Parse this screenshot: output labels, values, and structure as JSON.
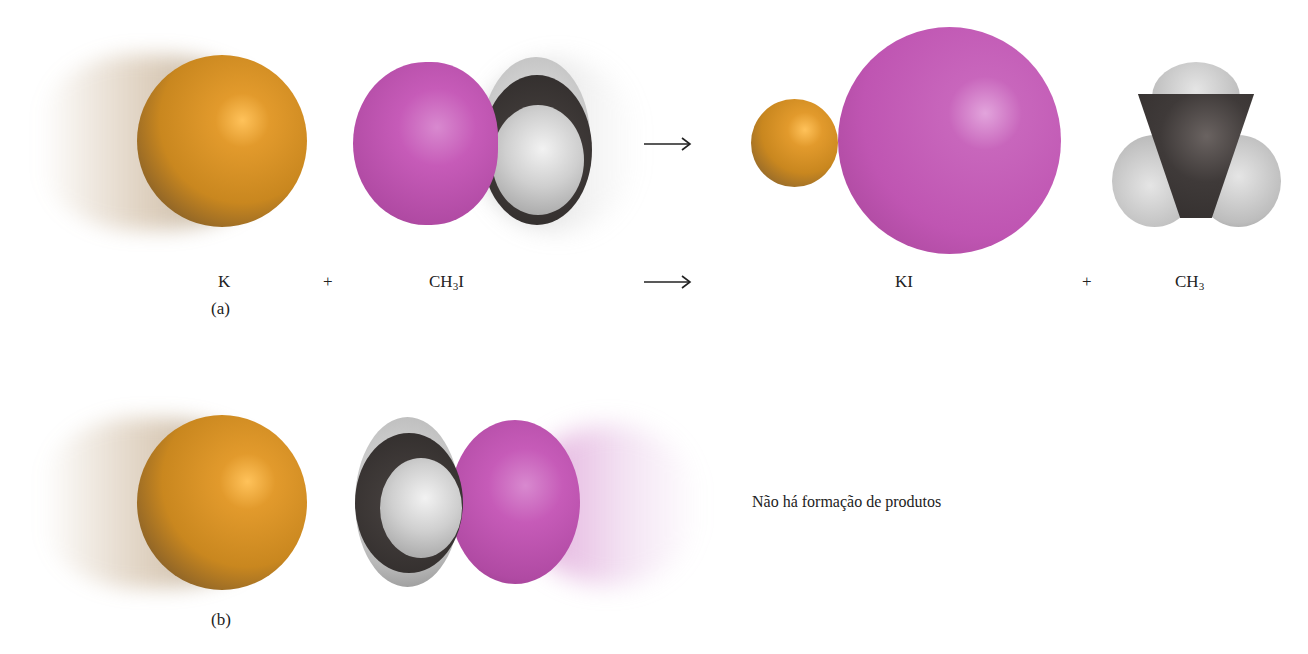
{
  "colors": {
    "potassium": "#d9952a",
    "iodine": "#c65bb8",
    "carbon": "#3d3938",
    "hydrogen": "#c9c9c9",
    "text": "#222222",
    "background": "#ffffff"
  },
  "panel_a": {
    "tag": "(a)",
    "reactant_1": {
      "symbol": "K",
      "atom": "potassium"
    },
    "plus_1": "+",
    "reactant_2": {
      "formula_main": "CH",
      "formula_sub": "3",
      "formula_tail": "I",
      "atoms": [
        "iodine",
        "carbon",
        "hydrogen"
      ]
    },
    "arrow": "⟶",
    "product_1": {
      "formula": "KI",
      "atoms": [
        "potassium",
        "iodine"
      ]
    },
    "plus_2": "+",
    "product_2": {
      "formula_main": "CH",
      "formula_sub": "3",
      "atoms": [
        "carbon",
        "hydrogen"
      ]
    }
  },
  "panel_b": {
    "tag": "(b)",
    "reactant_1": {
      "atom": "potassium"
    },
    "reactant_2": {
      "atoms": [
        "carbon",
        "hydrogen",
        "iodine"
      ],
      "orientation": "methyl group facing K"
    },
    "result_text": "Não há formação de produtos"
  }
}
